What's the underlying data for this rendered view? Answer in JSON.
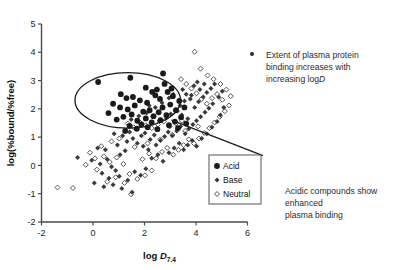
{
  "chart_data": {
    "type": "scatter",
    "title": "",
    "xlabel": "log D7.4",
    "xlabel_main": "log ",
    "xlabel_italic": "D",
    "xlabel_sub": "7.4",
    "ylabel": "log(%bound/%free)",
    "xlim": [
      -2,
      6
    ],
    "ylim": [
      -2,
      5
    ],
    "xticks": [
      "-2",
      "0",
      "2",
      "4",
      "6"
    ],
    "xtick_values": [
      -2,
      0,
      2,
      4,
      6
    ],
    "yticks": [
      "5",
      "4",
      "3",
      "2",
      "1",
      "0",
      "-1",
      "-2"
    ],
    "ytick_values": [
      5,
      4,
      3,
      2,
      1,
      0,
      -1,
      -2
    ],
    "grid": false,
    "legend_position": "bottom-center-inside",
    "series": [
      {
        "name": "Acid",
        "marker": "filled-circle",
        "color": "#1a1a1a",
        "points": [
          [
            0.2,
            2.95
          ],
          [
            1.45,
            3.1
          ],
          [
            2.72,
            3.25
          ],
          [
            2.05,
            2.75
          ],
          [
            2.3,
            2.6
          ],
          [
            1.55,
            2.42
          ],
          [
            1.3,
            2.38
          ],
          [
            1.82,
            2.3
          ],
          [
            2.1,
            2.22
          ],
          [
            1.05,
            2.05
          ],
          [
            1.35,
            1.98
          ],
          [
            1.62,
            2.12
          ],
          [
            2.42,
            2.48
          ],
          [
            2.48,
            2.68
          ],
          [
            2.6,
            2.35
          ],
          [
            1.18,
            1.72
          ],
          [
            1.5,
            1.8
          ],
          [
            1.95,
            1.9
          ],
          [
            2.2,
            1.95
          ],
          [
            0.92,
            1.62
          ],
          [
            1.72,
            1.58
          ],
          [
            2.05,
            1.66
          ],
          [
            2.35,
            1.74
          ],
          [
            2.55,
            1.88
          ],
          [
            2.7,
            2.05
          ],
          [
            1.42,
            1.4
          ],
          [
            1.88,
            1.45
          ],
          [
            2.28,
            1.52
          ],
          [
            2.62,
            1.6
          ],
          [
            2.85,
            1.78
          ],
          [
            3.0,
            2.15
          ],
          [
            3.1,
            2.45
          ],
          [
            2.9,
            2.6
          ],
          [
            3.22,
            1.95
          ],
          [
            3.35,
            2.28
          ],
          [
            1.25,
            1.22
          ],
          [
            1.7,
            1.3
          ],
          [
            2.12,
            1.35
          ],
          [
            2.5,
            1.28
          ],
          [
            2.95,
            1.42
          ],
          [
            3.18,
            1.55
          ],
          [
            3.42,
            1.7
          ],
          [
            3.55,
            2.05
          ],
          [
            3.3,
            1.32
          ],
          [
            3.62,
            1.48
          ],
          [
            0.6,
            1.85
          ],
          [
            0.78,
            2.18
          ],
          [
            1.08,
            2.52
          ],
          [
            2.78,
            2.88
          ],
          [
            3.05,
            2.72
          ]
        ]
      },
      {
        "name": "Base",
        "marker": "filled-diamond",
        "color": "#3a3a3a",
        "points": [
          [
            -0.6,
            0.28
          ],
          [
            -0.05,
            0.18
          ],
          [
            0.28,
            0.05
          ],
          [
            0.55,
            0.22
          ],
          [
            0.72,
            -0.05
          ],
          [
            0.35,
            -0.28
          ],
          [
            0.88,
            -0.18
          ],
          [
            1.05,
            0.38
          ],
          [
            1.25,
            0.52
          ],
          [
            0.48,
            0.55
          ],
          [
            0.18,
            0.62
          ],
          [
            0.95,
            0.72
          ],
          [
            1.32,
            0.85
          ],
          [
            1.55,
            0.95
          ],
          [
            1.15,
            1.05
          ],
          [
            0.82,
            1.12
          ],
          [
            1.42,
            1.18
          ],
          [
            1.68,
            1.28
          ],
          [
            1.88,
            1.05
          ],
          [
            2.02,
            1.15
          ],
          [
            2.22,
            0.92
          ],
          [
            2.38,
            1.08
          ],
          [
            1.72,
            0.78
          ],
          [
            1.95,
            0.68
          ],
          [
            2.15,
            0.55
          ],
          [
            2.45,
            0.72
          ],
          [
            2.62,
            0.88
          ],
          [
            2.78,
            1.02
          ],
          [
            2.92,
            1.18
          ],
          [
            3.08,
            1.05
          ],
          [
            3.25,
            1.22
          ],
          [
            3.4,
            1.38
          ],
          [
            3.58,
            1.12
          ],
          [
            3.72,
            1.3
          ],
          [
            3.88,
            1.45
          ],
          [
            4.02,
            1.58
          ],
          [
            4.18,
            1.72
          ],
          [
            4.35,
            1.88
          ],
          [
            4.5,
            2.02
          ],
          [
            4.65,
            2.18
          ],
          [
            3.95,
            2.05
          ],
          [
            4.1,
            2.25
          ],
          [
            4.28,
            2.42
          ],
          [
            4.42,
            2.58
          ],
          [
            4.58,
            2.72
          ],
          [
            3.78,
            2.35
          ],
          [
            3.62,
            2.52
          ],
          [
            3.48,
            2.68
          ],
          [
            3.92,
            2.82
          ],
          [
            4.05,
            2.95
          ],
          [
            1.02,
            -0.38
          ],
          [
            1.35,
            -0.52
          ],
          [
            1.62,
            -0.22
          ],
          [
            0.62,
            -0.45
          ],
          [
            1.85,
            -0.35
          ],
          [
            2.05,
            -0.12
          ],
          [
            2.28,
            0.25
          ],
          [
            2.52,
            0.38
          ],
          [
            2.72,
            0.15
          ],
          [
            2.95,
            0.45
          ],
          [
            3.15,
            0.62
          ],
          [
            3.35,
            0.78
          ],
          [
            3.52,
            0.55
          ],
          [
            3.68,
            0.72
          ],
          [
            3.85,
            0.88
          ],
          [
            4.02,
            0.68
          ],
          [
            4.22,
            0.95
          ],
          [
            4.42,
            1.12
          ],
          [
            4.62,
            1.35
          ],
          [
            4.82,
            1.55
          ],
          [
            4.95,
            1.78
          ],
          [
            5.08,
            2.05
          ],
          [
            4.88,
            2.42
          ],
          [
            5.02,
            2.62
          ],
          [
            4.72,
            2.88
          ],
          [
            1.48,
            1.62
          ],
          [
            1.78,
            1.75
          ],
          [
            2.08,
            1.85
          ],
          [
            2.32,
            1.72
          ],
          [
            2.58,
            1.58
          ],
          [
            2.85,
            1.68
          ],
          [
            3.02,
            1.82
          ],
          [
            3.28,
            1.92
          ],
          [
            3.45,
            1.78
          ],
          [
            3.68,
            1.65
          ],
          [
            2.18,
            2.12
          ],
          [
            2.42,
            2.05
          ],
          [
            2.68,
            2.22
          ],
          [
            2.95,
            2.38
          ],
          [
            3.12,
            2.52
          ],
          [
            3.38,
            2.12
          ],
          [
            3.55,
            2.28
          ],
          [
            3.82,
            2.48
          ],
          [
            4.15,
            2.68
          ],
          [
            4.32,
            2.88
          ],
          [
            0.05,
            -0.62
          ],
          [
            0.42,
            -0.75
          ],
          [
            0.78,
            -0.68
          ],
          [
            1.12,
            -0.82
          ],
          [
            1.52,
            -0.95
          ]
        ]
      },
      {
        "name": "Neutral",
        "marker": "open-diamond",
        "color": "#555555",
        "points": [
          [
            -1.38,
            -0.78
          ],
          [
            -0.78,
            -0.8
          ],
          [
            -0.28,
            0.02
          ],
          [
            0.08,
            0.25
          ],
          [
            0.42,
            0.32
          ],
          [
            0.15,
            -0.15
          ],
          [
            0.65,
            0.12
          ],
          [
            0.92,
            0.28
          ],
          [
            1.18,
            0.05
          ],
          [
            1.42,
            -0.3
          ],
          [
            1.48,
            -1.02
          ],
          [
            0.55,
            -0.58
          ],
          [
            0.88,
            -0.42
          ],
          [
            1.22,
            -0.62
          ],
          [
            1.72,
            -0.48
          ],
          [
            2.02,
            -0.35
          ],
          [
            2.28,
            -0.18
          ],
          [
            1.92,
            0.22
          ],
          [
            2.18,
            0.42
          ],
          [
            2.45,
            0.25
          ],
          [
            2.68,
            0.48
          ],
          [
            2.88,
            0.62
          ],
          [
            3.12,
            0.38
          ],
          [
            3.32,
            0.55
          ],
          [
            3.52,
            0.72
          ],
          [
            3.72,
            0.92
          ],
          [
            3.92,
            0.78
          ],
          [
            4.12,
            0.95
          ],
          [
            4.32,
            1.15
          ],
          [
            4.52,
            1.32
          ],
          [
            4.72,
            1.52
          ],
          [
            4.92,
            1.72
          ],
          [
            5.12,
            1.92
          ],
          [
            5.28,
            2.12
          ],
          [
            5.02,
            2.32
          ],
          [
            4.82,
            2.52
          ],
          [
            4.62,
            2.38
          ],
          [
            4.42,
            2.18
          ],
          [
            4.22,
            2.35
          ],
          [
            4.02,
            2.55
          ],
          [
            3.82,
            2.72
          ],
          [
            3.62,
            2.88
          ],
          [
            3.42,
            3.05
          ],
          [
            4.45,
            3.18
          ],
          [
            3.95,
            4.02
          ],
          [
            4.18,
            3.42
          ],
          [
            4.68,
            3.05
          ],
          [
            5.18,
            2.68
          ],
          [
            5.35,
            2.45
          ],
          [
            4.95,
            2.88
          ],
          [
            1.35,
            1.48
          ],
          [
            1.58,
            1.35
          ],
          [
            1.82,
            1.52
          ],
          [
            2.05,
            1.42
          ],
          [
            2.28,
            1.32
          ],
          [
            2.52,
            1.45
          ],
          [
            2.75,
            1.55
          ],
          [
            2.98,
            1.38
          ],
          [
            3.22,
            1.48
          ],
          [
            3.45,
            1.58
          ],
          [
            0.72,
            0.85
          ],
          [
            1.02,
            0.95
          ],
          [
            0.32,
            0.68
          ],
          [
            -0.12,
            0.45
          ],
          [
            1.62,
            0.65
          ],
          [
            2.12,
            0.78
          ],
          [
            2.62,
            0.92
          ],
          [
            3.08,
            1.08
          ],
          [
            3.58,
            1.22
          ],
          [
            4.08,
            1.38
          ]
        ]
      }
    ],
    "annotations": [
      {
        "id": "top-annotation",
        "bullet": true,
        "lines": [
          "Extent of plasma protein",
          "binding increases with",
          "increasing logD"
        ],
        "line3_prefix": "increasing log",
        "line3_italic": "D"
      },
      {
        "id": "bottom-annotation",
        "bullet": false,
        "lines": [
          "Acidic compounds show",
          "enhanced",
          "plasma binding"
        ]
      }
    ],
    "shapes": [
      {
        "type": "ellipse",
        "label": "acid-highlight-ellipse",
        "cx": 1.35,
        "cy": 2.3,
        "rx": 2.05,
        "ry": 0.98,
        "rotation": 0
      },
      {
        "type": "leader-line",
        "label": "acid-callout-leader",
        "from": [
          3.05,
          1.6
        ],
        "to": [
          6.6,
          0.35
        ]
      }
    ]
  },
  "legend": {
    "entries": [
      {
        "label": "Acid",
        "marker": "filled-circle"
      },
      {
        "label": "Base",
        "marker": "filled-diamond"
      },
      {
        "label": "Neutral",
        "marker": "open-diamond"
      }
    ]
  }
}
